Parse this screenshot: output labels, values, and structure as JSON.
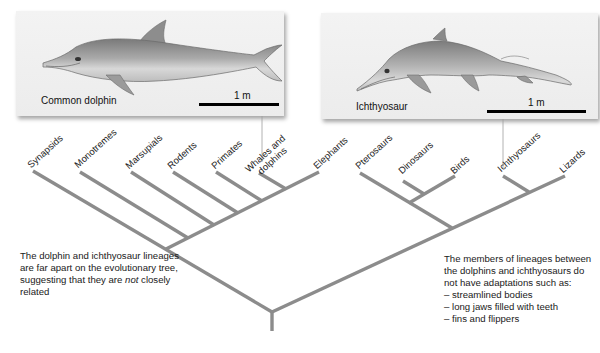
{
  "panels": {
    "dolphin": {
      "name": "Common dolphin",
      "scale_label": "1 m"
    },
    "ichthyosaur": {
      "name": "Ichthyosaur",
      "scale_label": "1 m"
    }
  },
  "tree": {
    "taxa": [
      {
        "id": "synapsids",
        "label": "Synapsids"
      },
      {
        "id": "monotremes",
        "label": "Monotremes"
      },
      {
        "id": "marsupials",
        "label": "Marsupials"
      },
      {
        "id": "rodents",
        "label": "Rodents"
      },
      {
        "id": "primates",
        "label": "Primates"
      },
      {
        "id": "whales",
        "label_line1": "Whales and",
        "label_line2": "dolphins"
      },
      {
        "id": "elephants",
        "label": "Elephants"
      },
      {
        "id": "pterosaurs",
        "label": "Pterosaurs"
      },
      {
        "id": "dinosaurs",
        "label": "Dinosaurs"
      },
      {
        "id": "birds",
        "label": "Birds"
      },
      {
        "id": "ichthyosaurs",
        "label": "Ichthyosaurs"
      },
      {
        "id": "lizards",
        "label": "Lizards"
      }
    ],
    "branch_color": "#8c8c8c",
    "connector_color": "#9a9a9a"
  },
  "notes": {
    "left": {
      "before_em": "The dolphin and ichthyosaur lineages are far apart on the evolutionary tree, suggesting that they are ",
      "em": "not",
      "after_em": " closely related"
    },
    "right": {
      "intro": "The members of lineages between the dolphins and ichthyosaurs do not have adaptations such as:",
      "items": [
        "– streamlined bodies",
        "– long jaws filled with teeth",
        "– fins and flippers"
      ]
    }
  }
}
